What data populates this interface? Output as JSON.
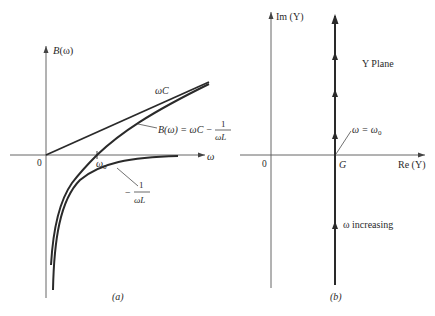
{
  "panel_a": {
    "caption": "(a)",
    "y_axis_label": "B(ω)",
    "x_axis_label": "ω",
    "origin_label": "0",
    "omega0_label": "ω",
    "omega0_sub": "0",
    "line_label": "ωC",
    "curve_label_lhs": "B(ω) = ωC −",
    "curve_label_frac_num": "1",
    "curve_label_frac_den": "ωL",
    "neg_curve_sign": "−",
    "neg_curve_frac_num": "1",
    "neg_curve_frac_den": "ωL"
  },
  "panel_b": {
    "caption": "(b)",
    "y_axis_label": "Im (Y)",
    "x_axis_label": "Re (Y)",
    "origin_label": "0",
    "g_label": "G",
    "plane_label": "Y Plane",
    "resonance_label": "ω = ω",
    "resonance_sub": "0",
    "increasing_label": "ω increasing"
  },
  "colors": {
    "ink": "#2a2a2a",
    "axis": "#555555",
    "background": "#ffffff"
  }
}
